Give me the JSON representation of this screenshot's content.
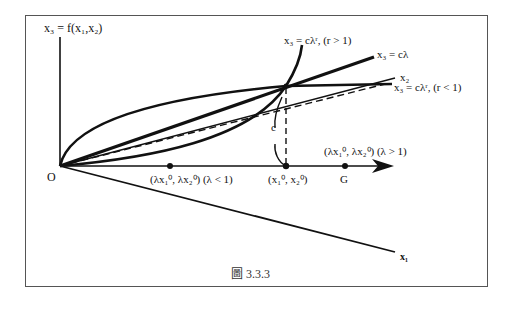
{
  "figure": {
    "caption": "圖 3.3.3",
    "labels": {
      "vertical_axis": "x₃ = f(x₁,x₂)",
      "origin": "O",
      "x1_axis": "x₁",
      "x2_axis": "x₂",
      "curve_r_gt_1": "x₃ = cλʳ,  (r > 1)",
      "line_linear": "x₃ = cλ",
      "curve_r_lt_1": "x₃ = cλʳ,  (r < 1)",
      "c_label": "c",
      "point_base": "(x₁⁰, x₂⁰)",
      "point_lambda_lt_1": "(λx₁⁰, λx₂⁰) (λ < 1)",
      "point_lambda_gt_1": "(λx₁⁰, λx₂⁰) (λ > 1)",
      "point_G": "G"
    },
    "colors": {
      "stroke": "#111111",
      "frame": "#555555",
      "background": "#ffffff"
    }
  }
}
